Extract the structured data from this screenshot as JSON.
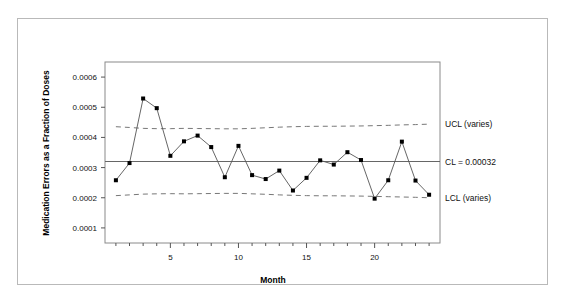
{
  "figure": {
    "background_color": "#ffffff",
    "frame_color": "#b9b9b9"
  },
  "chart_data": {
    "type": "line",
    "title": "",
    "xlabel": "Month",
    "ylabel": "Medication Errors as a Fraction of Doses",
    "xlim": [
      0.2,
      24.8
    ],
    "ylim": [
      5e-05,
      0.00065
    ],
    "xticks": [
      5,
      10,
      15,
      20
    ],
    "xtick_labels": [
      "5",
      "10",
      "15",
      "20"
    ],
    "xminor_ticks": [
      1,
      2,
      3,
      4,
      5,
      6,
      7,
      8,
      9,
      10,
      11,
      12,
      13,
      14,
      15,
      16,
      17,
      18,
      19,
      20,
      21,
      22,
      23,
      24
    ],
    "yticks": [
      0.0001,
      0.0002,
      0.0003,
      0.0004,
      0.0005,
      0.0006
    ],
    "ytick_labels": [
      "0.0001",
      "0.0002",
      "0.0003",
      "0.0004",
      "0.0005",
      "0.0006"
    ],
    "grid": false,
    "legend_position": "right-annotations",
    "x": [
      1,
      2,
      3,
      4,
      5,
      6,
      7,
      8,
      9,
      10,
      11,
      12,
      13,
      14,
      15,
      16,
      17,
      18,
      19,
      20,
      21,
      22,
      23,
      24
    ],
    "series": [
      {
        "name": "Medication error rate",
        "marker": "filled-square",
        "color": "#000000",
        "line_color": "#555555",
        "values": [
          0.000258,
          0.000315,
          0.000529,
          0.000497,
          0.000339,
          0.000387,
          0.000406,
          0.000368,
          0.000268,
          0.000372,
          0.000275,
          0.000262,
          0.00029,
          0.000224,
          0.000266,
          0.000324,
          0.00031,
          0.000351,
          0.000325,
          0.000197,
          0.000258,
          0.000386,
          0.000257,
          0.00021
        ]
      },
      {
        "name": "UCL (varies)",
        "marker": "none",
        "line_style": "dashed",
        "color": "#777777",
        "values": [
          0.0004355,
          0.000433,
          0.00043,
          0.000429,
          0.000429,
          0.00043,
          0.0004295,
          0.000429,
          0.0004285,
          0.0004285,
          0.00043,
          0.000432,
          0.000434,
          0.0004355,
          0.0004365,
          0.000437,
          0.000437,
          0.0004375,
          0.000438,
          0.000439,
          0.00044,
          0.0004415,
          0.0004425,
          0.000444
        ]
      },
      {
        "name": "CL = 0.00032",
        "marker": "none",
        "line_style": "solid",
        "color": "#666666",
        "constant": 0.00032
      },
      {
        "name": "LCL (varies)",
        "marker": "none",
        "line_style": "dashed",
        "color": "#777777",
        "values": [
          0.000207,
          0.0002095,
          0.000212,
          0.000213,
          0.0002135,
          0.000213,
          0.0002135,
          0.000214,
          0.0002145,
          0.0002145,
          0.000213,
          0.0002115,
          0.0002095,
          0.000208,
          0.000207,
          0.0002065,
          0.0002065,
          0.000206,
          0.0002055,
          0.0002045,
          0.0002035,
          0.0002025,
          0.0002015,
          0.0002
        ]
      }
    ],
    "annotations": [
      {
        "text": "UCL (varies)",
        "at_value": 0.000444
      },
      {
        "text": "CL = 0.00032",
        "at_value": 0.00032
      },
      {
        "text": "LCL (varies)",
        "at_value": 0.0002
      }
    ]
  }
}
